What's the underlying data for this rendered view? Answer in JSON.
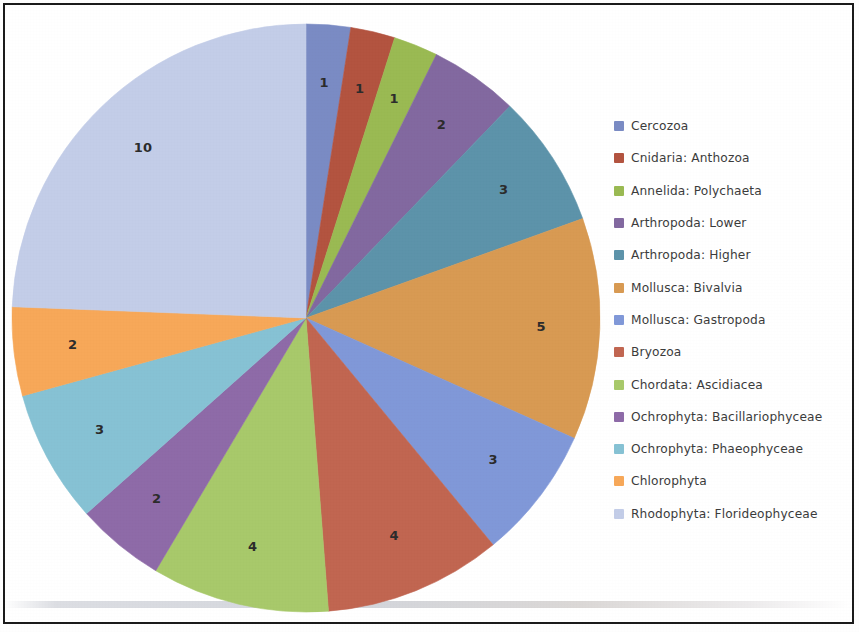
{
  "chart_data": {
    "type": "pie",
    "title": "",
    "subtitle": "",
    "xlabel": "",
    "ylabel": "",
    "grid": false,
    "legend_position": "right",
    "data_labels": "value",
    "start_angle_deg": 0,
    "direction": "clockwise",
    "total": 41,
    "categories": [
      "Cercozoa",
      "Cnidaria: Anthozoa",
      "Annelida: Polychaeta",
      "Arthropoda: Lower",
      "Arthropoda: Higher",
      "Mollusca: Bivalvia",
      "Mollusca: Gastropoda",
      "Bryozoa",
      "Chordata: Ascidiacea",
      "Ochrophyta: Bacillariophyceae",
      "Ochrophyta: Phaeophyceae",
      "Chlorophyta",
      "Rhodophyta: Florideophyceae"
    ],
    "values": [
      1,
      1,
      1,
      2,
      3,
      5,
      3,
      4,
      4,
      2,
      3,
      2,
      10
    ],
    "colors": [
      "#7a8bc4",
      "#b3533f",
      "#9aba52",
      "#8268a0",
      "#5c93aa",
      "#d89a52",
      "#8098d8",
      "#c16550",
      "#a8c96a",
      "#8e6aa8",
      "#86c2d4",
      "#f7a858",
      "#c3cde8"
    ],
    "slice_labels": [
      "1",
      "1",
      "1",
      "2",
      "3",
      "5",
      "3",
      "4",
      "4",
      "2",
      "3",
      "2",
      "10"
    ]
  },
  "legend": {
    "items": [
      {
        "label": "Cercozoa",
        "color": "#7a8bc4"
      },
      {
        "label": "Cnidaria: Anthozoa",
        "color": "#b3533f"
      },
      {
        "label": "Annelida: Polychaeta",
        "color": "#9aba52"
      },
      {
        "label": "Arthropoda: Lower",
        "color": "#8268a0"
      },
      {
        "label": "Arthropoda: Higher",
        "color": "#5c93aa"
      },
      {
        "label": "Mollusca: Bivalvia",
        "color": "#d89a52"
      },
      {
        "label": "Mollusca: Gastropoda",
        "color": "#8098d8"
      },
      {
        "label": "Bryozoa",
        "color": "#c16550"
      },
      {
        "label": "Chordata: Ascidiacea",
        "color": "#a8c96a"
      },
      {
        "label": "Ochrophyta: Bacillariophyceae",
        "color": "#8e6aa8"
      },
      {
        "label": "Ochrophyta: Phaeophyceae",
        "color": "#86c2d4"
      },
      {
        "label": "Chlorophyta",
        "color": "#f7a858"
      },
      {
        "label": "Rhodophyta: Florideophyceae",
        "color": "#c3cde8"
      }
    ]
  },
  "geometry": {
    "center_x": 306,
    "center_y": 318,
    "radius": 294
  }
}
